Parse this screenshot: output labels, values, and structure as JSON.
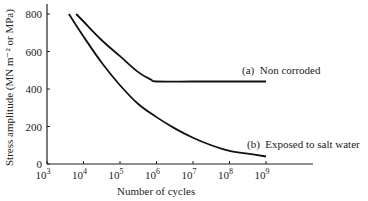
{
  "chart_data": {
    "type": "line",
    "title": "",
    "xlabel": "Number of cycles",
    "ylabel": "Stress amplitude (MN m⁻² or MPa)",
    "xscale": "log",
    "xlim_exp": [
      3,
      10
    ],
    "ylim": [
      0,
      850
    ],
    "grid": false,
    "legend_position": "inline labels at right",
    "x_ticks": [
      {
        "exp": 3,
        "label": "10",
        "sup": "3"
      },
      {
        "exp": 4,
        "label": "10",
        "sup": "4"
      },
      {
        "exp": 5,
        "label": "10",
        "sup": "5"
      },
      {
        "exp": 6,
        "label": "10",
        "sup": "6"
      },
      {
        "exp": 7,
        "label": "10",
        "sup": "7"
      },
      {
        "exp": 8,
        "label": "10",
        "sup": "8"
      },
      {
        "exp": 9,
        "label": "10",
        "sup": "9"
      }
    ],
    "y_ticks": [
      0,
      200,
      400,
      600,
      800
    ],
    "series": [
      {
        "name": "(a)  Non corroded",
        "log10_x": [
          3.8,
          4.0,
          4.5,
          5.0,
          5.5,
          5.85,
          6.0,
          7.0,
          8.0,
          9.0
        ],
        "values": [
          800,
          760,
          660,
          575,
          490,
          450,
          440,
          440,
          440,
          440
        ]
      },
      {
        "name": "(b)  Exposed to salt water",
        "log10_x": [
          3.6,
          4.0,
          4.5,
          5.0,
          5.5,
          6.0,
          6.5,
          7.0,
          7.5,
          8.0,
          8.5,
          9.0
        ],
        "values": [
          800,
          680,
          540,
          420,
          320,
          250,
          190,
          140,
          100,
          70,
          55,
          40
        ]
      }
    ]
  }
}
